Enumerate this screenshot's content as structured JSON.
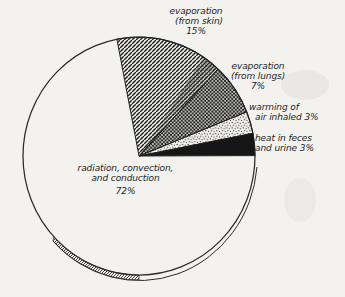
{
  "canvas": {
    "paper_color": "#f3f2ef",
    "ink_color": "#222222"
  },
  "chart_data": {
    "type": "pie",
    "title": "",
    "direction": "clockwise",
    "start_angle_deg": -11,
    "slices": [
      {
        "label": "evaporation (from skin)",
        "value": 15,
        "texture": "diagonal-hatch"
      },
      {
        "label": "evaporation (from lungs)",
        "value": 7,
        "texture": "crosshatch"
      },
      {
        "label": "warming of air inhaled",
        "value": 3,
        "texture": "stipple"
      },
      {
        "label": "heat in feces and urine",
        "value": 3,
        "texture": "solid-black"
      },
      {
        "label": "radiation, convection, and conduction",
        "value": 72,
        "texture": "plain"
      }
    ]
  },
  "labels": {
    "skin": {
      "line1": "evaporation",
      "line2": "(from skin)",
      "line3": "15%"
    },
    "lungs": {
      "line1": "evaporation",
      "line2": "(from lungs)",
      "line3": "7%"
    },
    "warming": {
      "line1": "warming of",
      "line2": "air inhaled 3%"
    },
    "feces": {
      "line1": "heat in feces",
      "line2": "and urine 3%"
    },
    "radiation": {
      "line1": "radiation, convection,",
      "line2": "and conduction",
      "line3": "72%"
    }
  }
}
